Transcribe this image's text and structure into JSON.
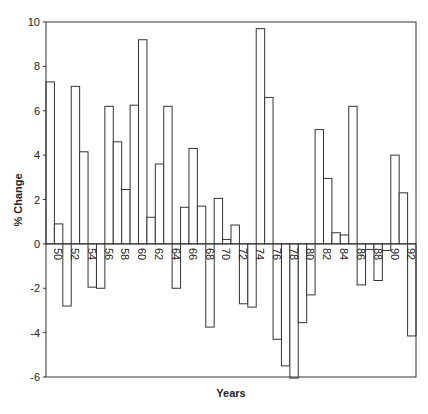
{
  "chart_data": {
    "type": "bar",
    "title": "",
    "xlabel": "Years",
    "ylabel": "% Change",
    "ylim": [
      -6,
      10
    ],
    "yticks": [
      -6,
      -4,
      -2,
      0,
      2,
      4,
      6,
      8,
      10
    ],
    "grid": false,
    "legend": null,
    "x_tick_labels": [
      "50",
      "52",
      "54",
      "56",
      "58",
      "60",
      "62",
      "64",
      "66",
      "68",
      "70",
      "72",
      "74",
      "76",
      "78",
      "80",
      "82",
      "84",
      "86",
      "88",
      "90",
      "92"
    ],
    "categories": [
      "50",
      "51",
      "52",
      "53",
      "54",
      "55",
      "56",
      "57",
      "58",
      "59",
      "60",
      "61",
      "62",
      "63",
      "64",
      "65",
      "66",
      "67",
      "68",
      "69",
      "70",
      "71",
      "72",
      "73",
      "74",
      "75",
      "76",
      "77",
      "78",
      "79",
      "80",
      "81",
      "82",
      "83",
      "84",
      "85",
      "86",
      "87",
      "88",
      "89",
      "90",
      "91",
      "92",
      "93"
    ],
    "values": [
      7.3,
      0.9,
      -2.8,
      7.1,
      4.15,
      -1.95,
      -2.0,
      6.2,
      4.6,
      2.45,
      6.25,
      9.2,
      1.2,
      3.6,
      6.2,
      -2.0,
      1.65,
      4.3,
      1.7,
      -3.75,
      2.05,
      0.2,
      0.85,
      -2.7,
      -2.85,
      9.7,
      6.6,
      -4.3,
      -5.5,
      -6.05,
      -3.55,
      -2.3,
      5.15,
      2.95,
      0.5,
      0.4,
      6.2,
      -1.85,
      -0.25,
      -1.65,
      -0.3,
      4.0,
      2.3,
      -4.15
    ]
  }
}
